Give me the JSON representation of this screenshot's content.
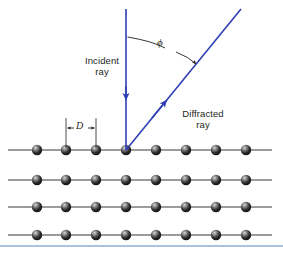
{
  "figure": {
    "background_color": "#ffffff",
    "width": 283,
    "height": 253
  },
  "labels": {
    "incident_ray": "Incident\nray",
    "diffracted_ray": "Diffracted\nray",
    "angle_symbol": "ϕ",
    "spacing_symbol": "D"
  },
  "colors": {
    "ray": "#2f3fb5",
    "lattice_line": "#3a3a3a",
    "atom_dark": "#1a1a1a",
    "atom_highlight": "#f2f2f2",
    "text": "#231f20",
    "slide_border": "#5b83c0"
  },
  "geometry": {
    "origin": {
      "x": 126,
      "y": 150
    },
    "incident_ray": {
      "x1": 126,
      "y1": 9,
      "x2": 126,
      "y2": 150,
      "arrow_at_y": 98
    },
    "diffracted_ray": {
      "x1": 126,
      "y1": 150,
      "x2": 241,
      "y2": 9,
      "arrow_at": {
        "x": 164,
        "y": 103
      }
    },
    "angle_arc": {
      "start": {
        "x": 127,
        "y": 37
      },
      "end": {
        "x": 196,
        "y": 64
      }
    },
    "spacing_marker": {
      "x_left": 66,
      "x_right": 96,
      "tick_top": 118,
      "tick_bottom": 150,
      "arrow_y": 128
    }
  },
  "lattice": {
    "row_y": [
      150,
      180,
      207,
      235
    ],
    "line_x_start": 8,
    "line_x_end": 272,
    "atom_x": [
      37,
      66,
      96,
      126,
      156,
      186,
      216,
      246
    ],
    "atom_radius": 5.2,
    "rows": 4,
    "atoms_per_row": 8
  }
}
